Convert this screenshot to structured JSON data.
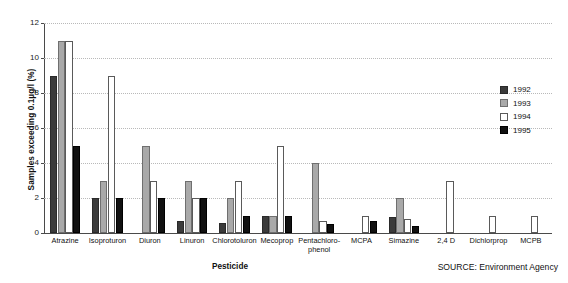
{
  "chart_data": {
    "type": "bar",
    "title": "",
    "subtitle": "",
    "xlabel": "Pesticide",
    "ylabel": "Samples exceeding 0.1µg/l (%)",
    "ylim": [
      0,
      12
    ],
    "yticks": [
      0,
      2,
      4,
      6,
      8,
      10,
      12
    ],
    "ytick_labels": [
      "0",
      "2",
      "4",
      "6",
      "8",
      "10",
      "12"
    ],
    "grid": "horizontal-dotted",
    "legend_position": "right",
    "categories": [
      "Atrazine",
      "Isoproturon",
      "Diuron",
      "Linuron",
      "Chlorotoluron",
      "Mecoprop",
      "Pentachloro-phenol",
      "MCPA",
      "Simazine",
      "2,4 D",
      "Dichlorprop",
      "MCPB"
    ],
    "series": [
      {
        "name": "1992",
        "color": "#3b3b3b",
        "values": [
          9,
          2,
          0,
          0.7,
          0.6,
          1,
          0,
          0,
          0.9,
          0,
          0,
          0
        ]
      },
      {
        "name": "1993",
        "color": "#a9a9a9",
        "values": [
          11,
          3,
          5,
          3,
          2,
          1,
          4,
          0,
          2,
          0,
          0,
          0
        ]
      },
      {
        "name": "1994",
        "color": "#ffffff",
        "values": [
          11,
          9,
          3,
          2,
          3,
          5,
          0.7,
          1,
          0.8,
          3,
          1,
          1
        ]
      },
      {
        "name": "1995",
        "color": "#111111",
        "values": [
          5,
          2,
          2,
          2,
          1,
          1,
          0.5,
          0.7,
          0.4,
          0,
          0,
          0
        ]
      }
    ],
    "annotations": [
      "SOURCE: Environment Agency"
    ]
  },
  "axes": {
    "y_title": "Samples exceeding 0.1µg/l (%)",
    "x_title": "Pesticide"
  },
  "legend": {
    "entries": [
      {
        "label": "1992"
      },
      {
        "label": "1993"
      },
      {
        "label": "1994"
      },
      {
        "label": "1995"
      }
    ]
  },
  "source": {
    "text": "SOURCE: Environment Agency"
  }
}
